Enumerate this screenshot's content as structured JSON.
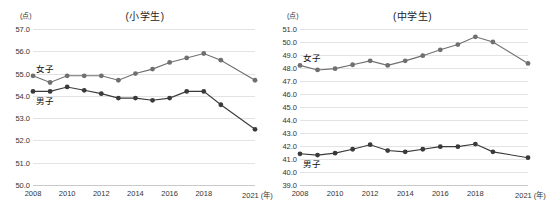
{
  "figure": {
    "unit_label": "(点)",
    "x_unit_label": "(年)"
  },
  "panels": [
    {
      "key": "elementary",
      "title": "(小学生)",
      "y_axis_unit": "(点)",
      "y_ticks": [
        "57.0",
        "56.0",
        "55.0",
        "54.0",
        "53.0",
        "52.0",
        "51.0",
        "50.0"
      ],
      "x_ticks": [
        "2008",
        "2010",
        "2012",
        "2014",
        "2016",
        "2018",
        "2021"
      ],
      "x_unit": "(年)",
      "series_labels": [
        {
          "name": "女子",
          "text": "女子"
        },
        {
          "name": "男子",
          "text": "男子"
        }
      ]
    },
    {
      "key": "junior-high",
      "title": "(中学生)",
      "y_axis_unit": "(点)",
      "y_ticks": [
        "51.0",
        "50.0",
        "49.0",
        "48.0",
        "47.0",
        "46.0",
        "45.0",
        "44.0",
        "43.0",
        "42.0",
        "41.0",
        "40.0",
        "39.0"
      ],
      "x_ticks": [
        "2008",
        "2010",
        "2012",
        "2014",
        "2016",
        "2018",
        "2021"
      ],
      "x_unit": "(年)",
      "series_labels": [
        {
          "name": "女子",
          "text": "女子"
        },
        {
          "name": "男子",
          "text": "男子"
        }
      ]
    }
  ],
  "chart_data": [
    {
      "type": "line",
      "title": "(小学生)",
      "xlabel": "(年)",
      "ylabel": "(点)",
      "x": [
        2008,
        2009,
        2010,
        2011,
        2012,
        2013,
        2014,
        2015,
        2016,
        2017,
        2018,
        2019,
        2021
      ],
      "xtick_labels": [
        "2008",
        "2010",
        "2012",
        "2014",
        "2016",
        "2018",
        "2021"
      ],
      "xtick_values": [
        2008,
        2010,
        2012,
        2014,
        2016,
        2018,
        2021
      ],
      "ylim": [
        50.0,
        57.0
      ],
      "ytick_values": [
        50.0,
        51.0,
        52.0,
        53.0,
        54.0,
        55.0,
        56.0,
        57.0
      ],
      "grid": true,
      "legend": "inline-labels",
      "series": [
        {
          "name": "女子",
          "color": "#6f6f6f",
          "values": [
            54.9,
            54.6,
            54.9,
            54.9,
            54.9,
            54.7,
            55.0,
            55.2,
            55.5,
            55.7,
            55.9,
            55.6,
            54.7
          ]
        },
        {
          "name": "男子",
          "color": "#3a3a3a",
          "values": [
            54.2,
            54.2,
            54.4,
            54.25,
            54.1,
            53.9,
            53.9,
            53.8,
            53.9,
            54.2,
            54.2,
            53.6,
            52.5
          ]
        }
      ]
    },
    {
      "type": "line",
      "title": "(中学生)",
      "xlabel": "(年)",
      "ylabel": "(点)",
      "x": [
        2008,
        2009,
        2010,
        2011,
        2012,
        2013,
        2014,
        2015,
        2016,
        2017,
        2018,
        2019,
        2021
      ],
      "xtick_labels": [
        "2008",
        "2010",
        "2012",
        "2014",
        "2016",
        "2018",
        "2021"
      ],
      "xtick_values": [
        2008,
        2010,
        2012,
        2014,
        2016,
        2018,
        2021
      ],
      "ylim": [
        39.0,
        51.0
      ],
      "ytick_values": [
        39.0,
        40.0,
        41.0,
        42.0,
        43.0,
        44.0,
        45.0,
        46.0,
        47.0,
        48.0,
        49.0,
        50.0,
        51.0
      ],
      "grid": true,
      "legend": "inline-labels",
      "series": [
        {
          "name": "女子",
          "color": "#6f6f6f",
          "values": [
            48.2,
            47.85,
            47.95,
            48.25,
            48.55,
            48.2,
            48.55,
            48.95,
            49.4,
            49.8,
            50.4,
            50.0,
            48.35
          ]
        },
        {
          "name": "男子",
          "color": "#3a3a3a",
          "values": [
            41.4,
            41.3,
            41.45,
            41.75,
            42.1,
            41.65,
            41.55,
            41.75,
            41.95,
            41.95,
            42.15,
            41.55,
            41.1
          ]
        }
      ]
    }
  ]
}
